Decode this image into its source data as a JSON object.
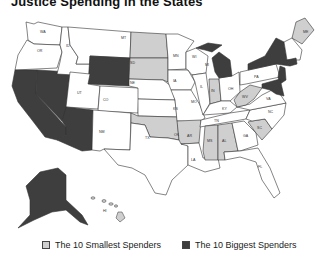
{
  "title": "Justice Spending in the States",
  "colors": {
    "smallest": "#cfcfcf",
    "biggest": "#3e3e3e",
    "neutral": "#ffffff",
    "border": "#333333"
  },
  "legend": {
    "smallest_label": "The 10 Smallest Spenders",
    "biggest_label": "The 10 Biggest Spenders"
  },
  "categories": {
    "smallest": [
      "ND",
      "SD",
      "OK",
      "AR",
      "MS",
      "AL",
      "IN",
      "WV",
      "SC",
      "ME",
      "HI"
    ],
    "biggest": [
      "CA",
      "NV",
      "AZ",
      "WY",
      "AK",
      "MI",
      "NY",
      "NJ",
      "MD",
      "DE",
      "CT"
    ]
  },
  "state_labels": {
    "WA": "WA",
    "OR": "OR",
    "ID": "ID",
    "MT": "MT",
    "ND": "ND",
    "SD": "SD",
    "MN": "MN",
    "WY": "WY",
    "NE": "NE",
    "IA": "IA",
    "CA": "CA",
    "NV": "NV",
    "UT": "UT",
    "CO": "CO",
    "KS": "KS",
    "MO": "MO",
    "AZ": "AZ",
    "NM": "NM",
    "OK": "OK",
    "AR": "AR",
    "TX": "TX",
    "LA": "LA",
    "MS": "MS",
    "AL": "AL",
    "GA": "GA",
    "FL": "FL",
    "TN": "TN",
    "KY": "KY",
    "IL": "IL",
    "IN": "IN",
    "OH": "OH",
    "MI": "MI",
    "WI": "WI",
    "WV": "WV",
    "VA": "VA",
    "NC": "NC",
    "SC": "SC",
    "PA": "PA",
    "NY": "NY",
    "ME": "ME",
    "AK": "AK",
    "HI": "HI"
  }
}
